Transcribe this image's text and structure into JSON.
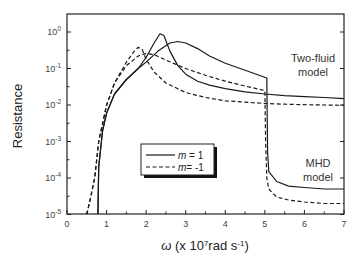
{
  "chart_data": {
    "type": "line",
    "title": "",
    "xlabel": "ω (x 10^7 rad s^-1)",
    "xlabel_parts": {
      "symbol": "ω",
      "pre": " (x 10",
      "exp1": "7",
      "mid": "rad s",
      "exp2": "-1",
      "post": ")"
    },
    "ylabel": "Resistance",
    "xlim": [
      0,
      7
    ],
    "ylim": [
      1e-05,
      3
    ],
    "yscale": "log",
    "x_ticks": [
      "0",
      "1",
      "2",
      "3",
      "4",
      "5",
      "6",
      "7"
    ],
    "y_ticks": [
      {
        "value": 1,
        "base": "10",
        "exp": "0"
      },
      {
        "value": 0.1,
        "base": "10",
        "exp": "-1"
      },
      {
        "value": 0.01,
        "base": "10",
        "exp": "-2"
      },
      {
        "value": 0.001,
        "base": "10",
        "exp": "-3"
      },
      {
        "value": 0.0001,
        "base": "10",
        "exp": "-4"
      },
      {
        "value": 1e-05,
        "base": "10",
        "exp": "-5"
      }
    ],
    "grid": false,
    "legend": {
      "position": "center-left inside",
      "entries": [
        {
          "label_var": "m",
          "label_rest": " = 1",
          "style": "solid"
        },
        {
          "label_var": "m",
          "label_rest": "= -1",
          "style": "dashed"
        }
      ]
    },
    "annotations": [
      {
        "text_line1": "Two-fluid",
        "text_line2": "model",
        "x": 6.3,
        "y": 0.15
      },
      {
        "text_line1": "MHD",
        "text_line2": "model",
        "x": 6.4,
        "y": 0.0002
      }
    ],
    "series": [
      {
        "name": "Two-fluid, m = 1",
        "style": "solid",
        "x": [
          0.78,
          0.8,
          0.9,
          1.0,
          1.2,
          1.5,
          1.8,
          2.0,
          2.2,
          2.35,
          2.45,
          2.6,
          2.8,
          3.0,
          3.3,
          3.6,
          4.0,
          4.5,
          5.0,
          5.5,
          6.0,
          6.5,
          7.0
        ],
        "y": [
          1e-05,
          0.0002,
          0.002,
          0.006,
          0.02,
          0.05,
          0.1,
          0.2,
          0.5,
          0.9,
          0.8,
          0.3,
          0.12,
          0.07,
          0.045,
          0.035,
          0.028,
          0.023,
          0.02,
          0.018,
          0.017,
          0.016,
          0.015
        ]
      },
      {
        "name": "Two-fluid, m = -1",
        "style": "dashed",
        "x": [
          0.5,
          0.6,
          0.7,
          0.8,
          1.0,
          1.2,
          1.5,
          1.7,
          1.8,
          1.9,
          2.0,
          2.2,
          2.5,
          2.8,
          3.0,
          3.5,
          4.0,
          4.5,
          5.0,
          5.5,
          6.0,
          6.5,
          7.0
        ],
        "y": [
          1e-05,
          3e-05,
          0.0001,
          0.001,
          0.01,
          0.04,
          0.15,
          0.3,
          0.38,
          0.33,
          0.18,
          0.08,
          0.04,
          0.028,
          0.022,
          0.016,
          0.013,
          0.012,
          0.011,
          0.0105,
          0.0102,
          0.01,
          0.0098
        ]
      },
      {
        "name": "MHD, m = 1",
        "style": "solid",
        "x": [
          0.78,
          0.8,
          0.9,
          1.0,
          1.2,
          1.5,
          1.8,
          2.0,
          2.3,
          2.6,
          2.8,
          3.0,
          3.3,
          3.6,
          4.0,
          4.5,
          5.05,
          5.07,
          5.1,
          5.3,
          5.6,
          6.0,
          6.5,
          7.0
        ],
        "y": [
          1e-05,
          0.0002,
          0.002,
          0.006,
          0.02,
          0.05,
          0.1,
          0.15,
          0.3,
          0.5,
          0.55,
          0.5,
          0.35,
          0.22,
          0.14,
          0.09,
          0.055,
          0.0005,
          0.00015,
          8e-05,
          6e-05,
          5.5e-05,
          5e-05,
          5e-05
        ]
      },
      {
        "name": "MHD, m = -1",
        "style": "dashed",
        "x": [
          0.5,
          0.6,
          0.7,
          0.8,
          1.0,
          1.2,
          1.5,
          1.8,
          2.0,
          2.2,
          2.5,
          3.0,
          3.5,
          4.0,
          4.5,
          5.0,
          5.02,
          5.05,
          5.1,
          5.3,
          5.6,
          6.0,
          6.5,
          7.0
        ],
        "y": [
          1e-05,
          3e-05,
          0.0001,
          0.001,
          0.01,
          0.04,
          0.12,
          0.22,
          0.26,
          0.24,
          0.17,
          0.1,
          0.065,
          0.045,
          0.033,
          0.025,
          0.001,
          0.0001,
          5e-05,
          3e-05,
          2.5e-05,
          2.2e-05,
          2e-05,
          2e-05
        ]
      }
    ]
  },
  "colors": {
    "line": "#1a1a1a",
    "axis": "#222222",
    "tick_text": "#444444",
    "legend_shadow": "#111111"
  }
}
